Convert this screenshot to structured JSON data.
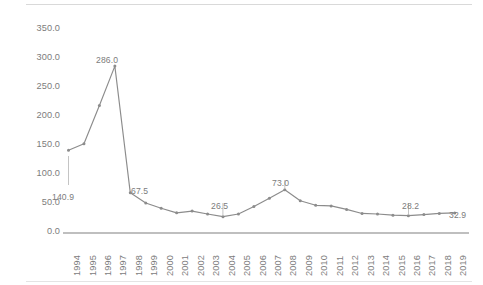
{
  "chart_data": {
    "type": "line",
    "title": "",
    "subtitle": "",
    "xlabel": "",
    "ylabel": "",
    "ylim": [
      0,
      350
    ],
    "y_ticks": [
      "0.0",
      "50.0",
      "100.0",
      "150.0",
      "200.0",
      "250.0",
      "300.0",
      "350.0"
    ],
    "grid": false,
    "legend": "none",
    "markers": true,
    "line_color": "#8c8c8c",
    "text_color": "#7c7c7c",
    "axis_color": "#bfbfbf",
    "categories": [
      "1994",
      "1995",
      "1996",
      "1997",
      "1998",
      "1999",
      "2000",
      "2001",
      "2002",
      "2003",
      "2004",
      "2005",
      "2006",
      "2007",
      "2008",
      "2009",
      "2010",
      "2011",
      "2012",
      "2013",
      "2014",
      "2015",
      "2016",
      "2017",
      "2018",
      "2019"
    ],
    "values": [
      140.9,
      152.0,
      218.0,
      286.0,
      67.5,
      50.0,
      41.0,
      33.0,
      36.0,
      31.0,
      26.5,
      31.0,
      44.0,
      58.0,
      73.0,
      54.0,
      46.0,
      45.0,
      39.0,
      32.0,
      31.0,
      29.0,
      28.2,
      30.0,
      32.0,
      32.9
    ],
    "point_labels": [
      {
        "category": "1994",
        "value": "140.9"
      },
      {
        "category": "1997",
        "value": "286.0"
      },
      {
        "category": "1998",
        "value": "67.5"
      },
      {
        "category": "2004",
        "value": "26.5"
      },
      {
        "category": "2008",
        "value": "73.0"
      },
      {
        "category": "2016",
        "value": "28.2"
      },
      {
        "category": "2019",
        "value": "32.9"
      }
    ]
  }
}
